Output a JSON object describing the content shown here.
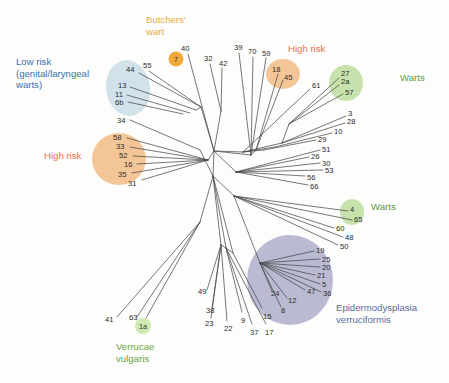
{
  "figure": {
    "type": "unrooted-phylogenetic-tree",
    "background": "#fdfdfc",
    "branch_color": "#4a4a4a"
  },
  "colors": {
    "low_risk_text": "#3c6ea8",
    "low_risk_blob": "#cfe0ea",
    "high_risk_text": "#e8734a",
    "high_risk_blob": "#f3c391",
    "butchers_text": "#e8ab45",
    "butchers_blob": "#f2a93b",
    "warts_text": "#5f9a3e",
    "warts_blob": "#c4e0a8",
    "verrucae_text": "#6aa546",
    "verrucae_blob": "#cfe8b4",
    "ev_text": "#5b6c9e",
    "ev_blob": "#b3b4ce"
  },
  "groups": [
    {
      "id": "low-risk",
      "label": "Low risk\n(genital/laryngeal\nwarts)",
      "color": "#3c6ea8",
      "blob": "#cfe0ea",
      "x": 16,
      "y": 56,
      "members": [
        "44",
        "55",
        "13",
        "11",
        "6b",
        "34"
      ]
    },
    {
      "id": "butchers-wart",
      "label": "Butchers'\nwart",
      "color": "#e8ab45",
      "blob": "#f2a93b",
      "x": 146,
      "y": 14,
      "members": [
        "7"
      ]
    },
    {
      "id": "high-risk-left",
      "label": "High risk",
      "color": "#e8734a",
      "blob": "#f3c391",
      "x": 44,
      "y": 150,
      "members": [
        "58",
        "33",
        "52",
        "16",
        "35",
        "31"
      ]
    },
    {
      "id": "high-risk-right",
      "label": "High risk",
      "color": "#e8734a",
      "blob": "#f3c391",
      "x": 288,
      "y": 43,
      "members": [
        "18",
        "45"
      ]
    },
    {
      "id": "warts-top",
      "label": "Warts",
      "color": "#5f9a3e",
      "blob": "#c4e0a8",
      "x": 400,
      "y": 72,
      "members": [
        "27",
        "2a",
        "57"
      ]
    },
    {
      "id": "warts-bottom",
      "label": "Warts",
      "color": "#5f9a3e",
      "blob": "#c4e0a8",
      "x": 371,
      "y": 201,
      "members": [
        "4",
        "65"
      ]
    },
    {
      "id": "epidermodysplasia-verruciformis",
      "label": "Epidermodysplasia\nverruciformis",
      "color": "#5b6c9e",
      "blob": "#b3b4ce",
      "x": 336,
      "y": 302,
      "members": [
        "19",
        "25",
        "20",
        "21",
        "5",
        "36",
        "47",
        "12",
        "24",
        "8"
      ]
    },
    {
      "id": "verrucae-vulgaris",
      "label": "Verrucae\nvulgaris",
      "color": "#6aa546",
      "blob": "#cfe8b4",
      "x": 116,
      "y": 341,
      "members": [
        "1a"
      ]
    }
  ],
  "badges": [
    {
      "name": "badge-7",
      "text": "7",
      "x": 176,
      "y": 59,
      "r": 7.5,
      "fill": "#f2a93b"
    },
    {
      "name": "badge-1a",
      "text": "1a",
      "x": 143,
      "y": 326,
      "r": 8.0,
      "fill": "#cfe8b4"
    }
  ],
  "blobs": [
    {
      "name": "low-risk-blob",
      "fill": "#cfe0ea",
      "cx": 128,
      "cy": 88,
      "rx": 22,
      "ry": 28,
      "rot": -8,
      "opacity": 0.95
    },
    {
      "name": "high-risk-left-blob",
      "fill": "#f3c391",
      "cx": 119,
      "cy": 159,
      "rx": 27,
      "ry": 26,
      "rot": 0,
      "opacity": 0.95
    },
    {
      "name": "high-risk-right-blob",
      "fill": "#f3c391",
      "cx": 283,
      "cy": 74,
      "rx": 17,
      "ry": 15,
      "rot": 0,
      "opacity": 0.95
    },
    {
      "name": "warts-top-blob",
      "fill": "#c4e0a8",
      "cx": 346,
      "cy": 83,
      "rx": 17,
      "ry": 18,
      "rot": 0,
      "opacity": 0.95
    },
    {
      "name": "warts-bottom-blob",
      "fill": "#c4e0a8",
      "cx": 352,
      "cy": 212,
      "rx": 12,
      "ry": 13,
      "rot": 0,
      "opacity": 0.95
    },
    {
      "name": "ev-blob",
      "fill": "#b3b4ce",
      "cx": 290,
      "cy": 280,
      "rx": 43,
      "ry": 45,
      "rot": 0,
      "opacity": 0.9
    }
  ],
  "tips": [
    {
      "id": "40",
      "label": "40",
      "lx": 181,
      "ly": 45,
      "tx": 188,
      "ty": 54,
      "bx": 214,
      "by": 151
    },
    {
      "id": "32",
      "label": "32",
      "lx": 204,
      "ly": 55,
      "tx": 210,
      "ty": 64,
      "bx": 221,
      "by": 111
    },
    {
      "id": "42",
      "label": "42",
      "lx": 219,
      "ly": 60,
      "tx": 222,
      "ty": 68,
      "bx": 221,
      "by": 111
    },
    {
      "id": "44",
      "label": "44",
      "lx": 126,
      "ly": 66,
      "tx": 139,
      "ty": 73,
      "bx": 201,
      "by": 107
    },
    {
      "id": "55",
      "label": "55",
      "lx": 143,
      "ly": 62,
      "tx": 149,
      "ty": 71,
      "bx": 201,
      "by": 107
    },
    {
      "id": "13",
      "label": "13",
      "lx": 118,
      "ly": 82,
      "tx": 130,
      "ty": 87,
      "bx": 196,
      "by": 110
    },
    {
      "id": "11",
      "label": "11",
      "lx": 115,
      "ly": 91,
      "tx": 127,
      "ty": 95,
      "bx": 190,
      "by": 113
    },
    {
      "id": "6b",
      "label": "6b",
      "lx": 115,
      "ly": 99,
      "tx": 128,
      "ty": 102,
      "bx": 183,
      "by": 114
    },
    {
      "id": "34",
      "label": "34",
      "lx": 117,
      "ly": 117,
      "tx": 130,
      "ty": 120,
      "bx": 200,
      "by": 150
    },
    {
      "id": "58",
      "label": "58",
      "lx": 113,
      "ly": 134,
      "tx": 127,
      "ty": 138,
      "bx": 208,
      "by": 160
    },
    {
      "id": "33",
      "label": "33",
      "lx": 116,
      "ly": 143,
      "tx": 130,
      "ty": 147,
      "bx": 208,
      "by": 160
    },
    {
      "id": "52",
      "label": "52",
      "lx": 119,
      "ly": 152,
      "tx": 133,
      "ty": 156,
      "bx": 208,
      "by": 160
    },
    {
      "id": "16",
      "label": "16",
      "lx": 124,
      "ly": 161,
      "tx": 137,
      "ty": 164,
      "bx": 208,
      "by": 160
    },
    {
      "id": "35",
      "label": "35",
      "lx": 118,
      "ly": 171,
      "tx": 132,
      "ty": 173,
      "bx": 208,
      "by": 160
    },
    {
      "id": "31",
      "label": "31",
      "lx": 128,
      "ly": 180,
      "tx": 142,
      "ty": 180,
      "bx": 208,
      "by": 160
    },
    {
      "id": "39",
      "label": "39",
      "lx": 234,
      "ly": 44,
      "tx": 239,
      "ty": 53,
      "bx": 251,
      "by": 155
    },
    {
      "id": "70",
      "label": "70",
      "lx": 248,
      "ly": 48,
      "tx": 253,
      "ty": 57,
      "bx": 251,
      "by": 155
    },
    {
      "id": "59",
      "label": "59",
      "lx": 262,
      "ly": 50,
      "tx": 266,
      "ty": 58,
      "bx": 251,
      "by": 155
    },
    {
      "id": "18",
      "label": "18",
      "lx": 272,
      "ly": 66,
      "tx": 278,
      "ty": 74,
      "bx": 256,
      "by": 150
    },
    {
      "id": "45",
      "label": "45",
      "lx": 284,
      "ly": 74,
      "tx": 283,
      "ty": 80,
      "bx": 256,
      "by": 150
    },
    {
      "id": "61",
      "label": "61",
      "lx": 312,
      "ly": 82,
      "tx": 310,
      "ty": 89,
      "bx": 243,
      "by": 152
    },
    {
      "id": "27",
      "label": "27",
      "lx": 341,
      "ly": 70,
      "tx": 339,
      "ty": 78,
      "bx": 289,
      "by": 124
    },
    {
      "id": "2a",
      "label": "2a",
      "lx": 341,
      "ly": 78,
      "tx": 339,
      "ty": 85,
      "bx": 289,
      "by": 124
    },
    {
      "id": "57",
      "label": "57",
      "lx": 345,
      "ly": 89,
      "tx": 343,
      "ty": 94,
      "bx": 289,
      "by": 124
    },
    {
      "id": "3",
      "label": "3",
      "lx": 348,
      "ly": 110,
      "tx": 346,
      "ty": 116,
      "bx": 282,
      "by": 143
    },
    {
      "id": "28",
      "label": "28",
      "lx": 347,
      "ly": 118,
      "tx": 345,
      "ty": 123,
      "bx": 282,
      "by": 143
    },
    {
      "id": "10",
      "label": "10",
      "lx": 334,
      "ly": 128,
      "tx": 332,
      "ty": 133,
      "bx": 275,
      "by": 147
    },
    {
      "id": "29",
      "label": "29",
      "lx": 318,
      "ly": 136,
      "tx": 316,
      "ty": 140,
      "bx": 264,
      "by": 150
    },
    {
      "id": "51",
      "label": "51",
      "lx": 322,
      "ly": 146,
      "tx": 320,
      "ty": 150,
      "bx": 236,
      "by": 172
    },
    {
      "id": "26",
      "label": "26",
      "lx": 311,
      "ly": 153,
      "tx": 309,
      "ty": 157,
      "bx": 236,
      "by": 172
    },
    {
      "id": "30",
      "label": "30",
      "lx": 322,
      "ly": 160,
      "tx": 320,
      "ty": 163,
      "bx": 236,
      "by": 172
    },
    {
      "id": "53",
      "label": "53",
      "lx": 325,
      "ly": 167,
      "tx": 323,
      "ty": 170,
      "bx": 236,
      "by": 172
    },
    {
      "id": "56",
      "label": "56",
      "lx": 307,
      "ly": 174,
      "tx": 305,
      "ty": 176,
      "bx": 236,
      "by": 172
    },
    {
      "id": "66",
      "label": "66",
      "lx": 310,
      "ly": 183,
      "tx": 308,
      "ty": 185,
      "bx": 236,
      "by": 172
    },
    {
      "id": "4",
      "label": "4",
      "lx": 350,
      "ly": 206,
      "tx": 348,
      "ty": 211,
      "bx": 234,
      "by": 196
    },
    {
      "id": "65",
      "label": "65",
      "lx": 354,
      "ly": 216,
      "tx": 352,
      "ty": 220,
      "bx": 234,
      "by": 196
    },
    {
      "id": "60",
      "label": "60",
      "lx": 336,
      "ly": 225,
      "tx": 334,
      "ty": 228,
      "bx": 234,
      "by": 196
    },
    {
      "id": "48",
      "label": "48",
      "lx": 345,
      "ly": 234,
      "tx": 343,
      "ty": 237,
      "bx": 234,
      "by": 196
    },
    {
      "id": "50",
      "label": "50",
      "lx": 340,
      "ly": 243,
      "tx": 338,
      "ty": 245,
      "bx": 234,
      "by": 196
    },
    {
      "id": "19",
      "label": "19",
      "lx": 316,
      "ly": 247,
      "tx": 314,
      "ty": 251,
      "bx": 260,
      "by": 263
    },
    {
      "id": "25",
      "label": "25",
      "lx": 322,
      "ly": 256,
      "tx": 320,
      "ty": 259,
      "bx": 260,
      "by": 263
    },
    {
      "id": "20",
      "label": "20",
      "lx": 322,
      "ly": 264,
      "tx": 320,
      "ty": 267,
      "bx": 260,
      "by": 263
    },
    {
      "id": "21",
      "label": "21",
      "lx": 317,
      "ly": 272,
      "tx": 315,
      "ty": 275,
      "bx": 260,
      "by": 263
    },
    {
      "id": "5",
      "label": "5",
      "lx": 322,
      "ly": 281,
      "tx": 320,
      "ty": 284,
      "bx": 260,
      "by": 263
    },
    {
      "id": "47",
      "label": "47",
      "lx": 307,
      "ly": 288,
      "tx": 305,
      "ty": 290,
      "bx": 260,
      "by": 263
    },
    {
      "id": "36",
      "label": "36",
      "lx": 323,
      "ly": 290,
      "tx": 321,
      "ty": 292,
      "bx": 260,
      "by": 263
    },
    {
      "id": "12",
      "label": "12",
      "lx": 288,
      "ly": 297,
      "tx": 287,
      "ty": 298,
      "bx": 260,
      "by": 263
    },
    {
      "id": "24",
      "label": "24",
      "lx": 271,
      "ly": 290,
      "tx": 272,
      "ty": 291,
      "bx": 260,
      "by": 263
    },
    {
      "id": "8",
      "label": "8",
      "lx": 281,
      "ly": 307,
      "tx": 281,
      "ty": 307,
      "bx": 260,
      "by": 263
    },
    {
      "id": "41",
      "label": "41",
      "lx": 105,
      "ly": 316,
      "tx": 117,
      "ty": 317,
      "bx": 200,
      "by": 222
    },
    {
      "id": "63",
      "label": "63",
      "lx": 129,
      "ly": 314,
      "tx": 137,
      "ty": 317,
      "bx": 200,
      "by": 222
    },
    {
      "id": "1a",
      "label": "",
      "lx": 143,
      "ly": 326,
      "tx": 146,
      "ty": 318,
      "bx": 200,
      "by": 222
    },
    {
      "id": "49",
      "label": "49",
      "lx": 198,
      "ly": 288,
      "tx": 207,
      "ty": 290,
      "bx": 221,
      "by": 245
    },
    {
      "id": "38",
      "label": "38",
      "lx": 206,
      "ly": 307,
      "tx": 212,
      "ty": 308,
      "bx": 221,
      "by": 245
    },
    {
      "id": "23",
      "label": "23",
      "lx": 205,
      "ly": 320,
      "tx": 211,
      "ty": 318,
      "bx": 221,
      "by": 245
    },
    {
      "id": "22",
      "label": "22",
      "lx": 224,
      "ly": 325,
      "tx": 227,
      "ty": 321,
      "bx": 221,
      "by": 245
    },
    {
      "id": "9",
      "label": "9",
      "lx": 241,
      "ly": 317,
      "tx": 242,
      "ty": 312,
      "bx": 226,
      "by": 248
    },
    {
      "id": "37",
      "label": "37",
      "lx": 250,
      "ly": 329,
      "tx": 252,
      "ty": 324,
      "bx": 226,
      "by": 248
    },
    {
      "id": "17",
      "label": "17",
      "lx": 265,
      "ly": 329,
      "tx": 266,
      "ty": 324,
      "bx": 226,
      "by": 248
    },
    {
      "id": "15",
      "label": "15",
      "lx": 263,
      "ly": 313,
      "tx": 262,
      "ty": 308,
      "bx": 233,
      "by": 253
    }
  ]
}
